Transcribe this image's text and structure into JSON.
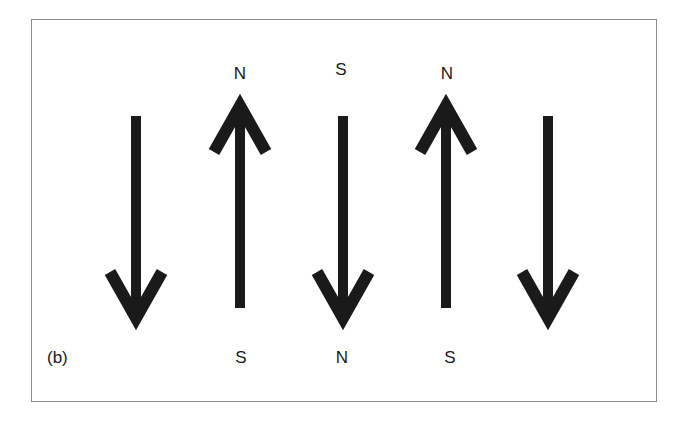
{
  "figure": {
    "panel_label": "(b)",
    "stroke_color": "#1a1a1a",
    "border_color": "#8a8a8a",
    "arrows": [
      {
        "index": 1,
        "direction": "down",
        "x": 136
      },
      {
        "index": 2,
        "direction": "up",
        "x": 240
      },
      {
        "index": 3,
        "direction": "down",
        "x": 343
      },
      {
        "index": 4,
        "direction": "up",
        "x": 446
      },
      {
        "index": 5,
        "direction": "down",
        "x": 548
      }
    ],
    "top_labels": [
      {
        "text": "N",
        "x": 240,
        "y": 72
      },
      {
        "text": "S",
        "x": 341,
        "y": 68
      },
      {
        "text": "N",
        "x": 447,
        "y": 72
      }
    ],
    "bottom_labels": [
      {
        "text": "S",
        "x": 241,
        "y": 356
      },
      {
        "text": "N",
        "x": 342,
        "y": 356
      },
      {
        "text": "S",
        "x": 450,
        "y": 356
      }
    ]
  }
}
